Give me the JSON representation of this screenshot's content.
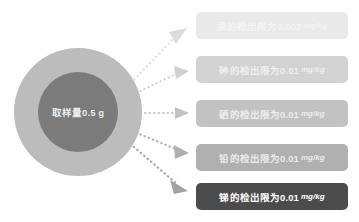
{
  "diagram": {
    "type": "radial-fan-out",
    "background_color": "#ffffff",
    "source": {
      "label": "取样量0.5 g",
      "outer_ring_color": "#bcbcbc",
      "inner_disc_color": "#7b7b7b",
      "label_color": "#f2f2f2"
    },
    "branches": [
      {
        "id": "mercury",
        "text": "汞的检出限为0.002",
        "unit": "mg/kg",
        "analyte": "汞",
        "limit_value": "0.002",
        "box_color": "#e9e9e9",
        "text_color": "#f4f4f4",
        "arrow_color": "#e2e2e2"
      },
      {
        "id": "arsenic",
        "text": "砷的检出限为0.01",
        "unit": "mg/kg",
        "analyte": "砷",
        "limit_value": "0.01",
        "box_color": "#d2d2d2",
        "text_color": "#efefef",
        "arrow_color": "#d6d6d6"
      },
      {
        "id": "selenium",
        "text": "硒的检出限为0.01",
        "unit": "mg/kg",
        "analyte": "硒",
        "limit_value": "0.01",
        "box_color": "#c2c2c2",
        "text_color": "#ededed",
        "arrow_color": "#c8c8c8"
      },
      {
        "id": "lead",
        "text": "铅的检出限为0.01",
        "unit": "mg/kg",
        "analyte": "铅",
        "limit_value": "0.01",
        "box_color": "#b0b0b0",
        "text_color": "#ebebeb",
        "arrow_color": "#b6b6b6"
      },
      {
        "id": "antimony",
        "text": "锑的检出限为0.01",
        "unit": "mg/kg",
        "analyte": "锑",
        "limit_value": "0.01",
        "box_color": "#4b4b4b",
        "text_color": "#ffffff",
        "arrow_color": "#a8a8a8"
      }
    ]
  }
}
